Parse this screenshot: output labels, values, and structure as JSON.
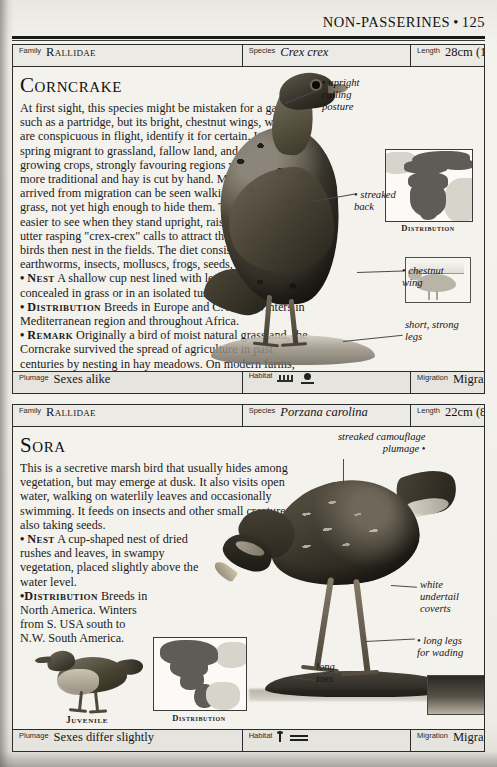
{
  "page": {
    "running_head": "NON-PASSERINES",
    "separator": "•",
    "page_number": "125"
  },
  "entries": [
    {
      "id": "corncrake",
      "header": {
        "family_label": "Family",
        "family_value": "Rallidae",
        "species_label": "Species",
        "species_value": "Crex crex",
        "length_label": "Length",
        "length_value": "28cm (11in)"
      },
      "title": "Corncrake",
      "paragraphs": [
        "At first sight, this species might be mistaken for a gamebird such as a partridge, but its bright, chestnut wings, which are conspicuous in flight, identify it for certain. It is a spring migrant to grassland, fallow land, and fields of growing crops, strongly favouring regions where farming is more traditional and hay is cut by hand. Males newly arrived from migration can be seen walking in the short grass, not yet high enough to hide them. They become still easier to see when they stand upright, raising their bills to utter rasping \"crex-crex\" calls to attract the females. The birds then nest in the fields. The diet consists of earthworms, insects, molluscs, frogs, seeds, and shoots."
      ],
      "facts": [
        {
          "keyword": "Nest",
          "text": "A shallow cup nest lined with leaves and grasses, concealed in grass or in an isolated tussock."
        },
        {
          "keyword": "Distribution",
          "text": "Breeds in Europe and C. Asia. Winters in Mediterranean region and throughout Africa."
        },
        {
          "keyword": "Remark",
          "text": "Originally a bird of moist natural grassland, the Corncrake survived the spread of agriculture in past centuries by nesting in hay meadows. On modern farms, mechanized hay production destroys nests, eggs, and young of Corncrakes, so the bird has become rare."
        }
      ],
      "annotations": [
        {
          "name": "upright-calling-posture",
          "text": "upright\ncalling\nposture",
          "bullet": "left"
        },
        {
          "name": "streaked-back",
          "text": "streaked\nback",
          "bullet": "left"
        },
        {
          "name": "chestnut-wing",
          "text": "chestnut\nwing",
          "bullet": "left"
        },
        {
          "name": "short-strong-legs",
          "text": "short, strong\nlegs",
          "bullet": "left"
        }
      ],
      "map_caption": "Distribution",
      "footer": {
        "plumage_label": "Plumage",
        "plumage_value": "Sexes alike",
        "habitat_label": "Habitat",
        "habitat_icons": [
          "grass-icon",
          "tree-icon"
        ],
        "migration_label": "Migration",
        "migration_value": "Migrant"
      }
    },
    {
      "id": "sora",
      "header": {
        "family_label": "Family",
        "family_value": "Rallidae",
        "species_label": "Species",
        "species_value": "Porzana carolina",
        "length_label": "Length",
        "length_value": "22cm (8½in)"
      },
      "title": "Sora",
      "paragraphs": [
        "This is a secretive marsh bird that usually hides among vegetation, but may emerge at dusk. It also visits open water, walking on waterlily leaves and occasionally swimming. It feeds on insects and other small creatures, also taking seeds."
      ],
      "facts": [
        {
          "keyword": "Nest",
          "text": "A cup-shaped nest of dried rushes and leaves, in swampy vegetation, placed slightly above the water level."
        },
        {
          "keyword": "Distribution",
          "text": "Breeds in North America. Winters from S. USA south to N.W. South America."
        }
      ],
      "annotations": [
        {
          "name": "streaked-camouflage-plumage",
          "text": "streaked camouflage\nplumage",
          "bullet": "right"
        },
        {
          "name": "white-undertail-coverts",
          "text": "white\nundertail\ncoverts",
          "bullet": "right"
        },
        {
          "name": "long-legs-for-wading",
          "text": "long legs\nfor wading",
          "bullet": "left"
        },
        {
          "name": "long-toes",
          "text": "long\ntoes",
          "bullet": "none"
        }
      ],
      "juvenile_caption": "Juvenile",
      "map_caption": "Distribution",
      "footer": {
        "plumage_label": "Plumage",
        "plumage_value": "Sexes differ slightly",
        "habitat_label": "Habitat",
        "habitat_icons": [
          "reed-icon",
          "water-icon"
        ],
        "migration_label": "Migration",
        "migration_value": "Migrant"
      }
    }
  ],
  "colors": {
    "paper": "#f2f0eb",
    "ink": "#151515",
    "rule": "#2b2b2b",
    "map_land": "#5e5c57"
  }
}
